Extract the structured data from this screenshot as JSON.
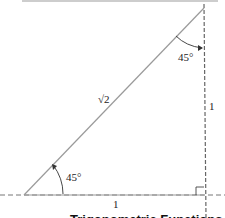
{
  "diagram": {
    "top_rule_color": "#bdbdbd",
    "line_color": "#888888",
    "labels": {
      "hypotenuse": "√2",
      "top_angle": "45°",
      "right_leg": "1",
      "bottom_angle": "45°",
      "bottom_leg": "1"
    },
    "caption_truncated": "Trigonometric Functions"
  }
}
